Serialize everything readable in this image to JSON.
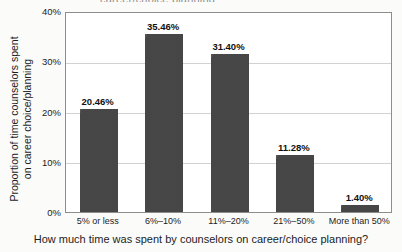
{
  "figure": {
    "title_remnant": "career/choice planning",
    "background_color": "#fbfbfa",
    "plot_background_color": "#ffffff",
    "frame_color": "#8d8d8d",
    "grid_color": "#d2d2d2",
    "bar_color": "#4a4a4a"
  },
  "chart_data": {
    "type": "bar",
    "title": "",
    "categories": [
      "5% or less",
      "6%–10%",
      "11%–20%",
      "21%–50%",
      "More than 50%"
    ],
    "values": [
      20.46,
      35.46,
      31.4,
      11.28,
      1.4
    ],
    "value_labels": [
      "20.46%",
      "35.46%",
      "31.40%",
      "11.28%",
      "1.40%"
    ],
    "xlabel": "How much time was spent by counselors on career/choice planning?",
    "ylabel_line1": "Proportion of time counselors spent",
    "ylabel_line2": "on career choice/planning",
    "ylim": [
      0,
      40
    ],
    "yticks": [
      0,
      10,
      20,
      30,
      40
    ],
    "ytick_labels": [
      "0%",
      "10%",
      "20%",
      "30%",
      "40%"
    ],
    "grid": true,
    "grid_axis": "y",
    "legend": false,
    "series": [
      {
        "name": "Proportion of time counselors spent on career choice/planning",
        "values": [
          20.46,
          35.46,
          31.4,
          11.28,
          1.4
        ]
      }
    ]
  }
}
